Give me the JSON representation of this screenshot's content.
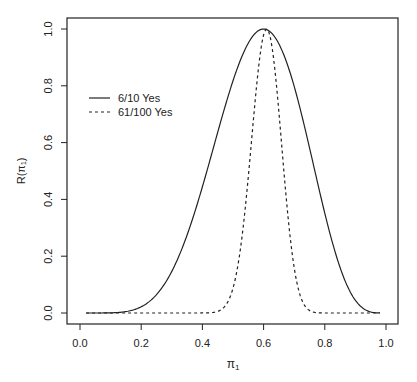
{
  "chart_data": {
    "type": "line",
    "title": "",
    "xlabel": "π1",
    "ylabel": "R(π1)",
    "xlim": [
      -0.04,
      1.04
    ],
    "ylim": [
      -0.04,
      1.04
    ],
    "grid": false,
    "legend_position": "upper-left",
    "x_ticks": [
      "0.0",
      "0.2",
      "0.4",
      "0.6",
      "0.8",
      "1.0"
    ],
    "y_ticks": [
      "0.0",
      "0.2",
      "0.4",
      "0.6",
      "0.8",
      "1.0"
    ],
    "series": [
      {
        "name": "6/10 Yes",
        "line_style": "solid",
        "k": 6,
        "n": 10,
        "x": [
          0.02,
          0.1,
          0.2,
          0.3,
          0.4,
          0.5,
          0.6,
          0.7,
          0.8,
          0.9,
          0.98
        ],
        "values": [
          0.0,
          0.0,
          0.03,
          0.2,
          0.55,
          0.89,
          1.0,
          0.78,
          0.38,
          0.06,
          0.0
        ]
      },
      {
        "name": "61/100 Yes",
        "line_style": "dashed",
        "k": 61,
        "n": 100,
        "x": [
          0.02,
          0.3,
          0.4,
          0.45,
          0.5,
          0.55,
          0.61,
          0.65,
          0.7,
          0.75,
          0.8,
          0.9,
          0.98
        ],
        "values": [
          0.0,
          0.0,
          0.0,
          0.01,
          0.09,
          0.43,
          1.0,
          0.67,
          0.18,
          0.01,
          0.0,
          0.0,
          0.0
        ]
      }
    ]
  },
  "axes": {
    "x_title_main": "π",
    "x_title_sub": "1",
    "y_title": "R(π₁)"
  },
  "legend": {
    "items": [
      {
        "label": "6/10 Yes"
      },
      {
        "label": "61/100 Yes"
      }
    ]
  }
}
